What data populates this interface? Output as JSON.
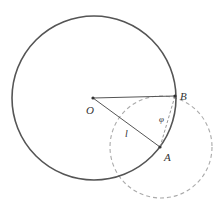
{
  "diagram": {
    "type": "geometry",
    "colors": {
      "main_circle": "#555555",
      "dashed_circle": "#aaaaaa",
      "segments": "#555555",
      "chord_dashed": "#999999",
      "labels": "#333333"
    },
    "points": {
      "O": {
        "label": "O",
        "x": 93,
        "y": 98
      },
      "A": {
        "label": "A",
        "x": 160,
        "y": 147
      },
      "B": {
        "label": "B",
        "x": 175,
        "y": 96
      }
    },
    "main_circle": {
      "center": "O",
      "radius": 82
    },
    "dashed_circle": {
      "center": "A",
      "radius": 51
    },
    "segments": [
      {
        "from": "O",
        "to": "B",
        "style": "solid"
      },
      {
        "from": "O",
        "to": "A",
        "style": "solid",
        "label": "l"
      },
      {
        "from": "A",
        "to": "B",
        "style": "dashed",
        "label": "φ"
      }
    ],
    "labels": {
      "O": "O",
      "A": "A",
      "B": "B",
      "l": "l",
      "phi": "φ"
    }
  }
}
